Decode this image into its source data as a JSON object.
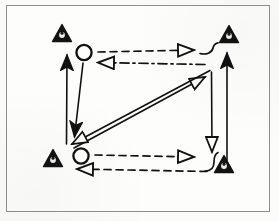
{
  "figure": {
    "title": "Cyclic process flow diagram with warning-triangle nodes",
    "background_color": "#fdfdfc",
    "frame_color": "#8e8e8e",
    "ink_color": "#111111",
    "frame": {
      "x": 6,
      "y": 5,
      "width": 264,
      "height": 207
    }
  },
  "nodes": {
    "triangles": [
      {
        "id": "triangle-top-left",
        "label": "warning-triangle-top-left",
        "cx": 62,
        "cy": 33,
        "size": 17
      },
      {
        "id": "triangle-top-right",
        "label": "warning-triangle-top-right",
        "cx": 229,
        "cy": 34,
        "size": 17
      },
      {
        "id": "triangle-bottom-left",
        "label": "warning-triangle-bottom-left",
        "cx": 53,
        "cy": 158,
        "size": 17
      },
      {
        "id": "triangle-bottom-right",
        "label": "warning-triangle-bottom-right",
        "cx": 224,
        "cy": 164,
        "size": 17
      }
    ],
    "circles": [
      {
        "id": "circle-upper",
        "label": "node-circle-upper",
        "cx": 84,
        "cy": 53,
        "r": 8
      },
      {
        "id": "circle-lower",
        "label": "node-circle-lower",
        "cx": 81,
        "cy": 156,
        "r": 8
      }
    ]
  },
  "connectors": [
    {
      "id": "arrow-top-dashed-right",
      "label": "dashed-arrow-top-rightward",
      "style": "dashed",
      "head": "hollow",
      "from": {
        "x": 98,
        "y": 52
      },
      "to": {
        "x": 196,
        "y": 50
      }
    },
    {
      "id": "arrow-top-dashdot-left",
      "label": "dash-dot-arrow-top-leftward",
      "style": "dash-dot",
      "head": "hollow",
      "from": {
        "x": 205,
        "y": 64
      },
      "to": {
        "x": 96,
        "y": 62
      }
    },
    {
      "id": "arrow-bottom-dashed-right",
      "label": "dashed-arrow-bottom-rightward",
      "style": "dashed",
      "head": "hollow",
      "from": {
        "x": 95,
        "y": 155
      },
      "to": {
        "x": 196,
        "y": 157
      }
    },
    {
      "id": "arrow-bottom-dashed-left",
      "label": "dashed-arrow-bottom-leftward",
      "style": "dashed",
      "head": "hollow",
      "from": {
        "x": 209,
        "y": 172
      },
      "to": {
        "x": 75,
        "y": 169
      }
    },
    {
      "id": "arrow-left-up-solid",
      "label": "solid-arrow-left-upward",
      "style": "solid",
      "head": "solid",
      "from": {
        "x": 66,
        "y": 144
      },
      "to": {
        "x": 67,
        "y": 52
      }
    },
    {
      "id": "arrow-left-down-solid",
      "label": "solid-arrow-left-downward",
      "style": "solid",
      "head": "solid",
      "from": {
        "x": 83,
        "y": 63
      },
      "to": {
        "x": 74,
        "y": 140
      }
    },
    {
      "id": "arrow-right-down-solid",
      "label": "solid-arrow-right-downward",
      "style": "solid",
      "head": "hollow",
      "from": {
        "x": 211,
        "y": 70
      },
      "to": {
        "x": 212,
        "y": 155
      }
    },
    {
      "id": "arrow-right-up-solid",
      "label": "solid-arrow-right-upward",
      "style": "solid",
      "head": "solid",
      "from": {
        "x": 227,
        "y": 163
      },
      "to": {
        "x": 227,
        "y": 50
      }
    },
    {
      "id": "arrow-diagonal-up-right",
      "label": "solid-diagonal-arrow-upper-right",
      "style": "solid",
      "head": "hollow",
      "from": {
        "x": 73,
        "y": 148
      },
      "to": {
        "x": 208,
        "y": 75
      }
    },
    {
      "id": "arrow-diagonal-down-left",
      "label": "solid-diagonal-arrow-lower-left",
      "style": "solid",
      "head": "hollow",
      "from": {
        "x": 211,
        "y": 70
      },
      "to": {
        "x": 69,
        "y": 146
      }
    },
    {
      "id": "hook-top-right",
      "label": "hook-connector-top-right",
      "style": "solid",
      "head": "none",
      "from": {
        "x": 199,
        "y": 52
      },
      "to": {
        "x": 219,
        "y": 43
      }
    },
    {
      "id": "hook-bottom-right",
      "label": "hook-connector-bottom-right",
      "style": "solid",
      "head": "none",
      "from": {
        "x": 207,
        "y": 170
      },
      "to": {
        "x": 217,
        "y": 152
      }
    }
  ],
  "legend": {
    "solid_label": "solid",
    "dashed_label": "dashed",
    "dash_dot_label": "dash-dot"
  }
}
